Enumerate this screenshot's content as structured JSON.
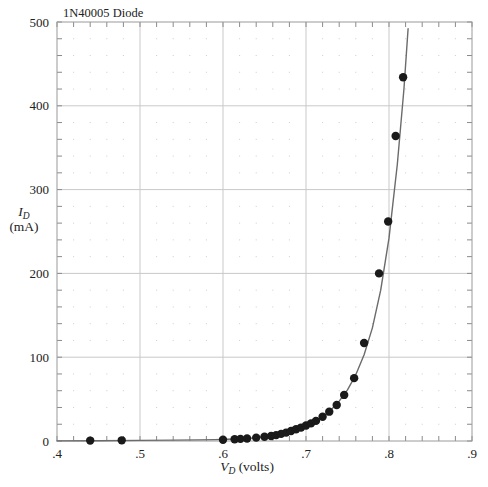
{
  "figure": {
    "title": "1N40005 Diode",
    "background_color": "#ffffff",
    "frame_color": "#9a9a9a",
    "grid_major_color": "#c9c9c9",
    "grid_dot_color": "#d8c9c9",
    "curve_color": "#6b6b6b",
    "marker_color": "#1a1a1a"
  },
  "chart_data": {
    "type": "scatter",
    "title": "1N40005 Diode",
    "xlabel": "V_D (volts)",
    "ylabel": "I_D (mA)",
    "xlabel_symbol": "V",
    "xlabel_subscript": "D",
    "xlabel_units": "(volts)",
    "ylabel_symbol": "I",
    "ylabel_subscript": "D",
    "ylabel_units": "(mA)",
    "xlim": [
      0.4,
      0.9
    ],
    "ylim": [
      0,
      500
    ],
    "xticks": [
      0.4,
      0.5,
      0.6,
      0.7,
      0.8,
      0.9
    ],
    "xticklabels": [
      ".4",
      ".5",
      ".6",
      ".7",
      ".8",
      ".9"
    ],
    "yticks": [
      0,
      100,
      200,
      300,
      400,
      500
    ],
    "yticklabels": [
      "0",
      "100",
      "200",
      "300",
      "400",
      "500"
    ],
    "x_minor_per_major": 5,
    "y_minor_per_major": 5,
    "grid": true,
    "grid_style": "major-lines-plus-minor-dots",
    "legend": "none",
    "series": [
      {
        "name": "measured",
        "marker": "filled-circle",
        "x": [
          0.44,
          0.478,
          0.6,
          0.614,
          0.621,
          0.629,
          0.64,
          0.65,
          0.658,
          0.664,
          0.67,
          0.676,
          0.682,
          0.688,
          0.694,
          0.7,
          0.706,
          0.712,
          0.72,
          0.728,
          0.737,
          0.746,
          0.758,
          0.77,
          0.788,
          0.799,
          0.808,
          0.817
        ],
        "y": [
          0.5,
          0.8,
          1.5,
          2.0,
          2.5,
          3.0,
          4.0,
          5.0,
          6.0,
          7.0,
          8.5,
          10.0,
          12.0,
          14.0,
          16.0,
          18.5,
          21.0,
          24.0,
          29.0,
          35.0,
          43.0,
          55.0,
          75.0,
          117.0,
          200.0,
          262.0,
          364.0,
          434.0
        ]
      }
    ],
    "curve": {
      "name": "fitted-curve",
      "x": [
        0.4,
        0.45,
        0.5,
        0.54,
        0.57,
        0.59,
        0.605,
        0.62,
        0.635,
        0.65,
        0.665,
        0.678,
        0.69,
        0.7,
        0.71,
        0.72,
        0.73,
        0.74,
        0.75,
        0.76,
        0.77,
        0.78,
        0.79,
        0.8,
        0.81,
        0.818,
        0.823
      ],
      "y": [
        0.1,
        0.3,
        0.7,
        1.0,
        1.3,
        1.6,
        2.0,
        2.6,
        3.6,
        5.0,
        7.2,
        10.0,
        13.5,
        17.5,
        22.5,
        29.0,
        37.0,
        47.5,
        61.0,
        79.0,
        103.0,
        135.0,
        180.0,
        242.0,
        330.0,
        420.0,
        492.0
      ]
    }
  }
}
